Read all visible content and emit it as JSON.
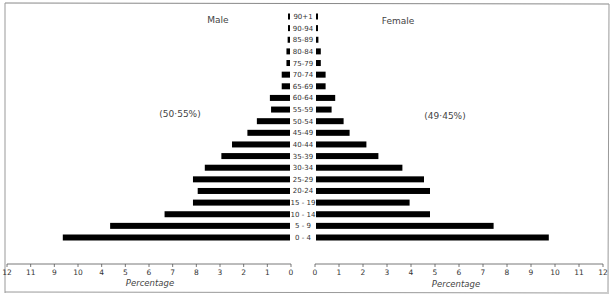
{
  "chart_data": {
    "type": "bar",
    "orientation": "horizontal-population-pyramid",
    "title": "",
    "left_label": "Male",
    "right_label": "Female",
    "male_share": "(50·55%)",
    "female_share": "(49·45%)",
    "xlabel_left": "Percentage",
    "xlabel_right": "Percentage",
    "xlim": [
      0,
      12
    ],
    "grid": false,
    "male_tick_labels": [
      "12",
      "11",
      "9",
      "10",
      "4",
      "5",
      "6",
      "7",
      "8",
      "3",
      "2",
      "1",
      "0"
    ],
    "female_tick_labels": [
      "0",
      "1",
      "2",
      "3",
      "4",
      "5",
      "6",
      "7",
      "8",
      "9",
      "10",
      "11",
      "12"
    ],
    "categories": [
      "0 - 4",
      "5 - 9",
      "10 - 14",
      "15 - 19",
      "20-24",
      "25-29",
      "30-34",
      "35-39",
      "40-44",
      "45-49",
      "50-54",
      "55-59",
      "60-64",
      "65-69",
      "70-74",
      "75-79",
      "80-84",
      "85-89",
      "90-94",
      "90+1"
    ],
    "series": [
      {
        "name": "Male",
        "values": [
          9.6,
          7.6,
          5.3,
          4.1,
          3.9,
          4.1,
          3.6,
          2.9,
          2.45,
          1.8,
          1.4,
          0.8,
          0.85,
          0.35,
          0.35,
          0.15,
          0.15,
          0.1,
          0.06,
          0.06
        ]
      },
      {
        "name": "Female",
        "values": [
          9.7,
          7.4,
          4.75,
          3.9,
          4.75,
          4.5,
          3.6,
          2.6,
          2.1,
          1.4,
          1.15,
          0.65,
          0.8,
          0.4,
          0.4,
          0.2,
          0.2,
          0.1,
          0.06,
          0.06
        ]
      }
    ],
    "bar_color": "#000000"
  }
}
